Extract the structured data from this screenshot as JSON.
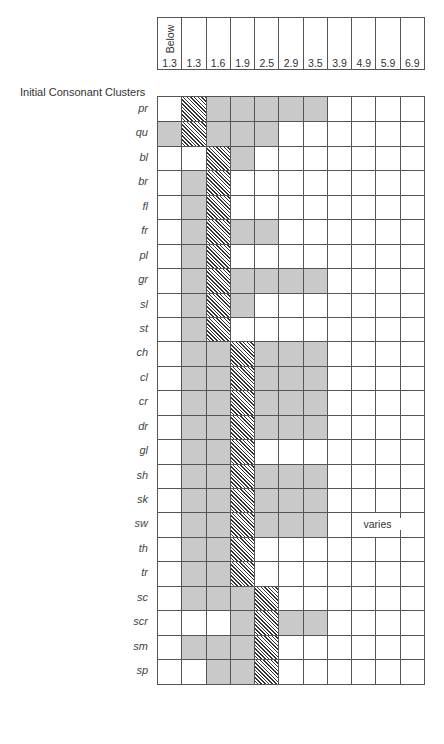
{
  "chart_data": {
    "type": "table",
    "title": "Initial Consonant Clusters",
    "columns": [
      "Below 1.3",
      "1.3",
      "1.6",
      "1.9",
      "2.5",
      "2.9",
      "3.5",
      "3.9",
      "4.9",
      "5.9",
      "6.9"
    ],
    "column_header_top": "Below",
    "column_header_values": [
      "1.3",
      "1.3",
      "1.6",
      "1.9",
      "2.5",
      "2.9",
      "3.5",
      "3.9",
      "4.9",
      "5.9",
      "6.9"
    ],
    "legend": {
      "0": "blank",
      "1": "shaded",
      "2": "hatched"
    },
    "rows": [
      {
        "label": "pr",
        "cells": [
          0,
          2,
          1,
          1,
          1,
          1,
          1,
          0,
          0,
          0,
          0
        ]
      },
      {
        "label": "qu",
        "cells": [
          1,
          2,
          1,
          1,
          1,
          0,
          0,
          0,
          0,
          0,
          0
        ]
      },
      {
        "label": "bl",
        "cells": [
          0,
          0,
          2,
          1,
          0,
          0,
          0,
          0,
          0,
          0,
          0
        ]
      },
      {
        "label": "br",
        "cells": [
          0,
          1,
          2,
          0,
          0,
          0,
          0,
          0,
          0,
          0,
          0
        ]
      },
      {
        "label": "fl",
        "cells": [
          0,
          1,
          2,
          0,
          0,
          0,
          0,
          0,
          0,
          0,
          0
        ]
      },
      {
        "label": "fr",
        "cells": [
          0,
          1,
          2,
          1,
          1,
          0,
          0,
          0,
          0,
          0,
          0
        ]
      },
      {
        "label": "pl",
        "cells": [
          0,
          1,
          2,
          0,
          0,
          0,
          0,
          0,
          0,
          0,
          0
        ]
      },
      {
        "label": "gr",
        "cells": [
          0,
          1,
          2,
          1,
          1,
          1,
          1,
          0,
          0,
          0,
          0
        ]
      },
      {
        "label": "sl",
        "cells": [
          0,
          1,
          2,
          1,
          0,
          0,
          0,
          0,
          0,
          0,
          0
        ]
      },
      {
        "label": "st",
        "cells": [
          0,
          1,
          2,
          0,
          0,
          0,
          0,
          0,
          0,
          0,
          0
        ]
      },
      {
        "label": "ch",
        "cells": [
          0,
          1,
          1,
          2,
          1,
          1,
          1,
          0,
          0,
          0,
          0
        ]
      },
      {
        "label": "cl",
        "cells": [
          0,
          1,
          1,
          2,
          1,
          1,
          1,
          0,
          0,
          0,
          0
        ]
      },
      {
        "label": "cr",
        "cells": [
          0,
          1,
          1,
          2,
          1,
          1,
          1,
          0,
          0,
          0,
          0
        ]
      },
      {
        "label": "dr",
        "cells": [
          0,
          1,
          1,
          2,
          1,
          1,
          1,
          0,
          0,
          0,
          0
        ]
      },
      {
        "label": "gl",
        "cells": [
          0,
          1,
          1,
          2,
          0,
          0,
          0,
          0,
          0,
          0,
          0
        ]
      },
      {
        "label": "sh",
        "cells": [
          0,
          1,
          1,
          2,
          1,
          1,
          1,
          0,
          0,
          0,
          0
        ]
      },
      {
        "label": "sk",
        "cells": [
          0,
          1,
          1,
          2,
          1,
          1,
          1,
          0,
          0,
          0,
          0
        ]
      },
      {
        "label": "sw",
        "cells": [
          0,
          1,
          1,
          2,
          1,
          1,
          1,
          0,
          0,
          0,
          0
        ]
      },
      {
        "label": "th",
        "cells": [
          0,
          1,
          1,
          2,
          0,
          0,
          0,
          0,
          0,
          0,
          0
        ]
      },
      {
        "label": "tr",
        "cells": [
          0,
          1,
          1,
          2,
          0,
          0,
          0,
          0,
          0,
          0,
          0
        ]
      },
      {
        "label": "sc",
        "cells": [
          0,
          1,
          1,
          1,
          2,
          0,
          0,
          0,
          0,
          0,
          0
        ]
      },
      {
        "label": "scr",
        "cells": [
          0,
          0,
          0,
          1,
          2,
          1,
          1,
          0,
          0,
          0,
          0
        ]
      },
      {
        "label": "sm",
        "cells": [
          0,
          1,
          1,
          1,
          2,
          0,
          0,
          0,
          0,
          0,
          0
        ]
      },
      {
        "label": "sp",
        "cells": [
          0,
          0,
          1,
          1,
          2,
          0,
          0,
          0,
          0,
          0,
          0
        ]
      }
    ],
    "annotations": [
      {
        "text": "varies",
        "row": "sw",
        "columns": [
          "4.9",
          "5.9"
        ]
      }
    ]
  },
  "labels": {
    "title": "Initial Consonant Clusters",
    "below": "Below",
    "varies": "varies"
  }
}
